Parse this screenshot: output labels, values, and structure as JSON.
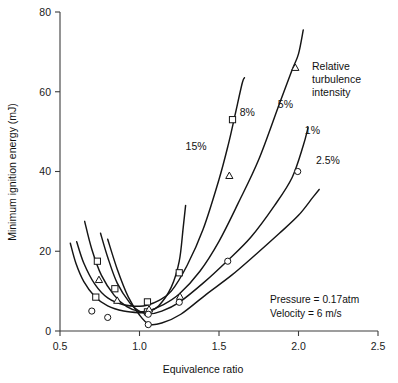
{
  "chart_data": {
    "type": "line",
    "title": "",
    "xlabel": "Equivalence ratio",
    "ylabel": "Minimum ignition energy (mJ)",
    "xlim": [
      0.5,
      2.5
    ],
    "ylim": [
      0,
      80
    ],
    "xticks": [
      "0.5",
      "1.0",
      "1.5",
      "2.0",
      "2.5"
    ],
    "xtick_values": [
      0.5,
      1.0,
      1.5,
      2.0,
      2.5
    ],
    "yticks": [
      "0",
      "20",
      "40",
      "60",
      "80"
    ],
    "ytick_values": [
      0,
      20,
      40,
      60,
      80
    ],
    "grid": false,
    "legend_position": "inline-curve-labels",
    "legend_title": "Relative turbulence intensity",
    "legend_title_lines": [
      "Relative",
      "turbulence",
      "intensity"
    ],
    "annotations": [
      {
        "text": "Pressure = 0.17atm"
      },
      {
        "text": "Velocity   = 6 m/s"
      }
    ],
    "series": [
      {
        "name": "15%",
        "label": "15%",
        "label_x": 1.29,
        "label_y": 45.5,
        "marker": "square",
        "x": [
          0.565,
          0.6,
          0.65,
          0.72,
          0.8,
          0.9,
          1.0,
          1.05,
          1.12,
          1.2,
          1.25,
          1.275,
          1.29
        ],
        "y": [
          22.0,
          17.0,
          12.4,
          8.6,
          6.3,
          5.0,
          4.6,
          4.8,
          6.3,
          11.0,
          17.5,
          26.0,
          31.5
        ],
        "markers": [
          {
            "x": 0.725,
            "y": 8.5
          },
          {
            "x": 1.05,
            "y": 4.8
          }
        ]
      },
      {
        "name": "8%",
        "label": "8%",
        "label_x": 1.63,
        "label_y": 54.0,
        "marker": "square",
        "x": [
          0.605,
          0.65,
          0.72,
          0.8,
          0.9,
          1.0,
          1.05,
          1.12,
          1.2,
          1.3,
          1.4,
          1.5,
          1.56,
          1.6,
          1.645,
          1.66
        ],
        "y": [
          22.4,
          17.0,
          11.7,
          8.3,
          6.6,
          6.2,
          6.5,
          7.6,
          10.0,
          16.5,
          25.5,
          38.0,
          47.0,
          54.0,
          62.0,
          63.5
        ],
        "markers": [
          {
            "x": 0.735,
            "y": 17.5
          },
          {
            "x": 0.845,
            "y": 10.6
          },
          {
            "x": 1.05,
            "y": 7.3
          },
          {
            "x": 1.25,
            "y": 14.6
          },
          {
            "x": 1.585,
            "y": 53.0
          }
        ]
      },
      {
        "name": "5%",
        "label": "5%",
        "label_x": 1.87,
        "label_y": 56.0,
        "marker": "triangle",
        "x": [
          0.655,
          0.7,
          0.76,
          0.84,
          0.92,
          1.0,
          1.06,
          1.14,
          1.25,
          1.38,
          1.5,
          1.62,
          1.75,
          1.88,
          1.96,
          2.0,
          2.03
        ],
        "y": [
          27.5,
          20.5,
          14.0,
          9.0,
          6.1,
          4.9,
          5.1,
          6.4,
          9.3,
          15.0,
          22.5,
          32.0,
          43.0,
          57.0,
          65.5,
          69.5,
          75.5
        ],
        "markers": [
          {
            "x": 0.745,
            "y": 12.8
          },
          {
            "x": 0.86,
            "y": 7.6
          },
          {
            "x": 1.06,
            "y": 5.4
          },
          {
            "x": 1.255,
            "y": 8.6
          },
          {
            "x": 1.565,
            "y": 38.9
          },
          {
            "x": 1.98,
            "y": 66.0
          }
        ]
      },
      {
        "name": "1%",
        "label": "1%",
        "label_x": 2.04,
        "label_y": 49.5,
        "marker": "circle",
        "x": [
          0.755,
          0.8,
          0.86,
          0.94,
          1.0,
          1.06,
          1.14,
          1.25,
          1.4,
          1.55,
          1.7,
          1.85,
          1.96,
          2.03,
          2.06
        ],
        "y": [
          24.5,
          18.5,
          12.0,
          7.0,
          4.9,
          4.3,
          5.0,
          7.2,
          12.0,
          17.5,
          23.5,
          31.5,
          38.5,
          46.5,
          51.0
        ],
        "markers": [
          {
            "x": 0.7,
            "y": 5.0
          },
          {
            "x": 1.055,
            "y": 4.2
          },
          {
            "x": 1.25,
            "y": 7.2
          },
          {
            "x": 1.555,
            "y": 17.5
          },
          {
            "x": 1.995,
            "y": 40.0
          }
        ]
      },
      {
        "name": "2.5%",
        "label": "2.5%",
        "label_x": 2.11,
        "label_y": 42.0,
        "marker": "circle",
        "x": [
          0.8,
          0.86,
          0.93,
          1.0,
          1.06,
          1.14,
          1.26,
          1.42,
          1.58,
          1.74,
          1.88,
          2.0,
          2.09,
          2.13
        ],
        "y": [
          23.0,
          15.5,
          8.5,
          4.0,
          1.7,
          2.0,
          4.2,
          9.2,
          14.0,
          19.5,
          24.5,
          29.0,
          33.5,
          35.5
        ],
        "markers": [
          {
            "x": 0.8,
            "y": 3.4
          },
          {
            "x": 1.055,
            "y": 1.6
          }
        ]
      }
    ]
  }
}
